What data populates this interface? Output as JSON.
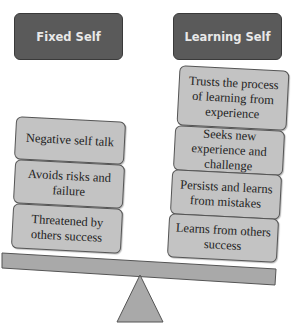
{
  "diagram": {
    "type": "seesaw",
    "left": {
      "title": "Fixed Self",
      "items": [
        "Negative self talk",
        "Avoids risks and failure",
        "Threatened by others success"
      ]
    },
    "right": {
      "title": "Learning Self",
      "items": [
        "Trusts the process of learning from experience",
        "Seeks new experience and challenge",
        "Persists and learns from mistakes",
        "Learns from others success"
      ]
    },
    "colors": {
      "header_fill": "#5a5a5a",
      "header_text": "#e8e8e8",
      "box_fill": "#c3c3c3",
      "beam_fill": "#a9a9a9",
      "fulcrum_fill": "#a9a9a9",
      "outline": "#555555"
    }
  }
}
